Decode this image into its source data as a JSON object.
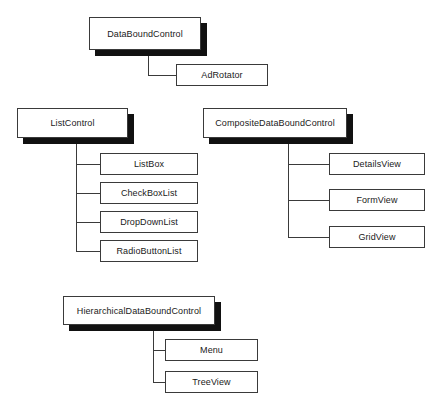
{
  "diagram": {
    "type": "class-hierarchy",
    "background_color": "#ffffff",
    "box_border_color": "#3a3a3a",
    "shadow_color": "#111111",
    "text_color": "#1a1a1a",
    "groups": [
      {
        "id": "databoundcontrol",
        "parent": {
          "label": "DataBoundControl",
          "has_shadow": true
        },
        "children": [
          {
            "label": "AdRotator"
          }
        ]
      },
      {
        "id": "listcontrol",
        "parent": {
          "label": "ListControl",
          "has_shadow": true
        },
        "children": [
          {
            "label": "ListBox"
          },
          {
            "label": "CheckBoxList"
          },
          {
            "label": "DropDownList"
          },
          {
            "label": "RadioButtonList"
          }
        ]
      },
      {
        "id": "compositedataboundcontrol",
        "parent": {
          "label": "CompositeDataBoundControl",
          "has_shadow": true
        },
        "children": [
          {
            "label": "DetailsView"
          },
          {
            "label": "FormView"
          },
          {
            "label": "GridView"
          }
        ]
      },
      {
        "id": "hierarchicaldataboundcontrol",
        "parent": {
          "label": "HierarchicalDataBoundControl",
          "has_shadow": true
        },
        "children": [
          {
            "label": "Menu"
          },
          {
            "label": "TreeView"
          }
        ]
      }
    ]
  }
}
